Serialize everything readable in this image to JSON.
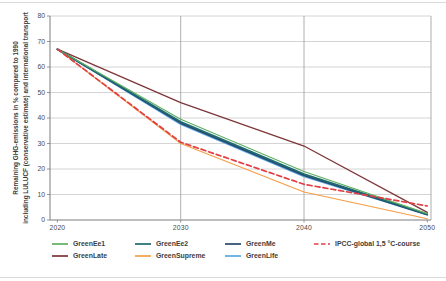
{
  "figure": {
    "y_axis_label_line1": "Remaining GHG-emissions in % compared to 1990",
    "y_axis_label_line2": "including LULUCF (conservative estimate) and international transport"
  },
  "chart_data": {
    "type": "line",
    "title": "",
    "xlabel": "",
    "ylabel": "Remaining GHG-emissions in % compared to 1990 including LULUCF (conservative estimate) and international transport",
    "x": [
      2020,
      2030,
      2040,
      2050
    ],
    "x_tick_labels": [
      "2020",
      "2030",
      "2040",
      "2050"
    ],
    "xlim": [
      2019.4,
      2050.3
    ],
    "ylim": [
      0,
      80
    ],
    "y_ticks": [
      0,
      10,
      20,
      30,
      40,
      50,
      60,
      70,
      80
    ],
    "grid": true,
    "legend_position": "bottom",
    "series": [
      {
        "name": "GreenEe1",
        "color": "#5fae62",
        "dash": "solid",
        "width": 1.1,
        "values": [
          67,
          39.5,
          19,
          2.5
        ]
      },
      {
        "name": "GreenEe2",
        "color": "#1e6a70",
        "dash": "solid",
        "width": 1.7,
        "values": [
          67,
          38.5,
          18,
          2.3
        ]
      },
      {
        "name": "GreenMe",
        "color": "#27486f",
        "dash": "solid",
        "width": 1.7,
        "values": [
          67,
          38,
          17.5,
          2.1
        ]
      },
      {
        "name": "GreenLate",
        "color": "#7e3538",
        "dash": "solid",
        "width": 1.3,
        "values": [
          67,
          46,
          29,
          3
        ]
      },
      {
        "name": "GreenSupreme",
        "color": "#f59d44",
        "dash": "solid",
        "width": 1.1,
        "values": [
          67,
          30,
          11,
          0.5
        ]
      },
      {
        "name": "GreenLife",
        "color": "#57a9e2",
        "dash": "solid",
        "width": 1.5,
        "values": [
          67,
          37.5,
          17,
          2
        ]
      },
      {
        "name": "IPCC-global 1,5 °C-course",
        "color": "#e23d42",
        "dash": "dashed",
        "width": 1.7,
        "values": [
          67,
          30.5,
          14,
          5.5
        ]
      }
    ],
    "draw_order": [
      "GreenSupreme",
      "GreenLate",
      "GreenLife",
      "GreenMe",
      "GreenEe2",
      "GreenEe1",
      "IPCC-global 1,5 °C-course"
    ],
    "legend_rows": [
      [
        "GreenEe1",
        "GreenEe2",
        "GreenMe",
        "IPCC-global 1,5 °C-course"
      ],
      [
        "GreenLate",
        "GreenSupreme",
        "GreenLife"
      ]
    ]
  },
  "colors": {
    "background": "#ffffff",
    "grid": "#c9c9c9",
    "axis": "#7c7c7c",
    "decade_line": "#9a9a9a",
    "tick_text": "#4a4a4a",
    "legend_text": "#3d3d3d",
    "edge": "#dadada"
  }
}
